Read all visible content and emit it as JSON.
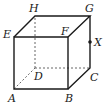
{
  "figure": {
    "type": "cube",
    "labels": {
      "A": "A",
      "B": "B",
      "C": "C",
      "D": "D",
      "E": "E",
      "F": "F",
      "G": "G",
      "H": "H",
      "X": "X"
    },
    "colors": {
      "stroke": "#1a1a1a",
      "hidden": "#555555",
      "background": "#ffffff"
    },
    "vertices": {
      "A": [
        14,
        89
      ],
      "B": [
        68,
        89
      ],
      "C": [
        90,
        68
      ],
      "D": [
        35,
        68
      ],
      "E": [
        14,
        37
      ],
      "F": [
        68,
        37
      ],
      "G": [
        90,
        16
      ],
      "H": [
        35,
        16
      ]
    },
    "point_X": {
      "on_edge": "GC",
      "position": [
        90,
        42
      ]
    },
    "visible_edges": [
      "AB",
      "BF",
      "FE",
      "EA",
      "EH",
      "HG",
      "GF",
      "GC",
      "BC"
    ],
    "hidden_edges": [
      "AD",
      "DC",
      "DH"
    ]
  }
}
